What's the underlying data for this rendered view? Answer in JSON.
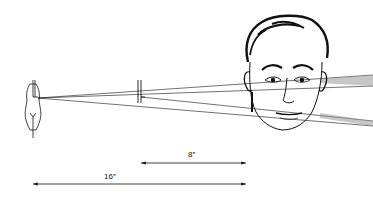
{
  "diagram": {
    "colors": {
      "line": "#111111",
      "background": "#ffffff",
      "shade": "#9a9a9a"
    },
    "elements": {
      "light_source": "lamp-bulb",
      "card": "vertical-card",
      "subject": "man-head"
    },
    "measurements": [
      {
        "label": "8″",
        "from": "card",
        "to": "face"
      },
      {
        "label": "16″",
        "from": "lamp",
        "to": "face"
      }
    ]
  }
}
